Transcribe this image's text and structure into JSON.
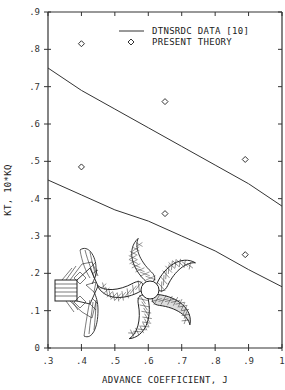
{
  "chart_data": {
    "type": "line",
    "title": "",
    "xlabel": "ADVANCE COEFFICIENT, J",
    "ylabel": "KT, 10*KQ",
    "xlim": [
      0.3,
      1.0
    ],
    "ylim": [
      0,
      0.9
    ],
    "grid": false,
    "legend_position": "upper right",
    "x_ticks": [
      ".3",
      ".4",
      ".5",
      ".6",
      ".7",
      ".8",
      ".9",
      "1"
    ],
    "y_ticks": [
      "0",
      ".1",
      ".2",
      ".3",
      ".4",
      ".5",
      ".6",
      ".7",
      ".8",
      ".9"
    ],
    "legend": [
      {
        "label": "DTNSRDC DATA [10]",
        "marker": "line"
      },
      {
        "label": "PRESENT THEORY",
        "marker": "diamond"
      }
    ],
    "series": [
      {
        "name": "DTNSRDC DATA [10] - 10*KQ",
        "style": "line",
        "x": [
          0.3,
          0.4,
          0.5,
          0.6,
          0.7,
          0.8,
          0.9,
          1.0
        ],
        "y": [
          0.75,
          0.69,
          0.64,
          0.59,
          0.54,
          0.49,
          0.44,
          0.38
        ]
      },
      {
        "name": "DTNSRDC DATA [10] - KT",
        "style": "line",
        "x": [
          0.3,
          0.4,
          0.5,
          0.6,
          0.7,
          0.8,
          0.9,
          1.0
        ],
        "y": [
          0.45,
          0.41,
          0.37,
          0.34,
          0.3,
          0.26,
          0.21,
          0.164
        ]
      },
      {
        "name": "PRESENT THEORY - 10*KQ",
        "style": "diamond",
        "x": [
          0.4,
          0.65,
          0.89
        ],
        "y": [
          0.815,
          0.66,
          0.505
        ]
      },
      {
        "name": "PRESENT THEORY - KT",
        "style": "diamond",
        "x": [
          0.4,
          0.65,
          0.89
        ],
        "y": [
          0.485,
          0.36,
          0.25
        ]
      }
    ],
    "annotations": [
      "propeller side-view wireframe illustration",
      "propeller front-view wireframe illustration (5 skewed blades)"
    ]
  }
}
